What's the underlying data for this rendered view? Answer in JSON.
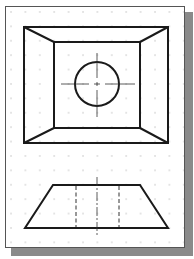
{
  "drawing": {
    "title": "Orthographic views: top view (frustum with hole) and front view (trapezoid with hidden lines)",
    "colors": {
      "line": "#1a1a1a",
      "grid": "#b8b8b8",
      "shadow": "#8a8a8a",
      "paper": "#ffffff"
    },
    "grid_spacing_px": 14,
    "top_view": {
      "outer_square": [
        24,
        27,
        168,
        143
      ],
      "inner_square": [
        54,
        42,
        140,
        128
      ],
      "circle": {
        "cx": 97,
        "cy": 84,
        "r": 22
      }
    },
    "front_view": {
      "trapezoid": {
        "top_y": 185,
        "top_x": [
          53,
          140
        ],
        "bottom_y": 228,
        "bottom_x": [
          25,
          168
        ]
      },
      "hidden_lines_x": [
        76,
        119
      ],
      "centerline_x": 97
    }
  }
}
